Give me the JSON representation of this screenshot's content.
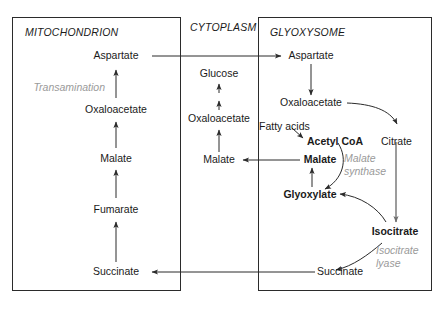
{
  "diagram": {
    "compartments": [
      {
        "name": "MITOCHONDRION",
        "id": "mitochondrion"
      },
      {
        "name": "CYTOPLASM",
        "id": "cytoplasm"
      },
      {
        "name": "GLYOXYSOME",
        "id": "glyoxysome"
      }
    ],
    "mitochondrion": {
      "metabolites": [
        {
          "label": "Aspartate",
          "bold": false
        },
        {
          "label": "Oxaloacetate",
          "bold": false
        },
        {
          "label": "Malate",
          "bold": false
        },
        {
          "label": "Fumarate",
          "bold": false
        },
        {
          "label": "Succinate",
          "bold": false
        }
      ],
      "enzymes": [
        {
          "label": "Transamination"
        }
      ]
    },
    "cytoplasm": {
      "metabolites": [
        {
          "label": "Glucose",
          "bold": false
        },
        {
          "label": "Oxaloacetate",
          "bold": false
        },
        {
          "label": "Malate",
          "bold": false
        }
      ]
    },
    "glyoxysome": {
      "metabolites": [
        {
          "label": "Aspartate",
          "bold": false
        },
        {
          "label": "Oxaloacetate",
          "bold": false
        },
        {
          "label": "Fatty acids",
          "bold": false
        },
        {
          "label": "Acetyl CoA",
          "bold": true
        },
        {
          "label": "Citrate",
          "bold": false
        },
        {
          "label": "Malate",
          "bold": true
        },
        {
          "label": "Glyoxylate",
          "bold": true
        },
        {
          "label": "Isocitrate",
          "bold": true
        },
        {
          "label": "Succinate",
          "bold": false
        }
      ],
      "enzymes": [
        {
          "label_line1": "Malate",
          "label_line2": "synthase"
        },
        {
          "label_line1": "Isocitrate",
          "label_line2": "lyase"
        }
      ]
    },
    "colors": {
      "stroke": "#2b2b2b",
      "text": "#1a1a1a",
      "enzyme_text": "#9a9a9a",
      "background": "#ffffff"
    }
  }
}
